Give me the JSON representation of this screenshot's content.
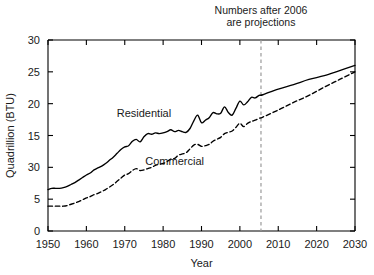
{
  "chart_data": {
    "type": "line",
    "title": "",
    "xlabel": "Year",
    "ylabel": "Quadrillion (BTU)",
    "xlim": [
      1950,
      2030
    ],
    "ylim": [
      0,
      30
    ],
    "grid": false,
    "legend": "inline-labels",
    "x_ticks": [
      "1950",
      "1960",
      "1970",
      "1980",
      "1990",
      "2000",
      "2010",
      "2020",
      "2030"
    ],
    "x_tick_values": [
      1950,
      1960,
      1970,
      1980,
      1990,
      2000,
      2010,
      2020,
      2030
    ],
    "y_ticks": [
      "30",
      "25",
      "20",
      "15",
      "30",
      "5",
      "0"
    ],
    "y_tick_values": [
      30,
      25,
      20,
      15,
      10,
      5,
      0
    ],
    "annotations": [
      {
        "name": "projection-note",
        "line1": "Numbers after 2006",
        "line2": "are projections",
        "rule_at_x": 2005.5
      }
    ],
    "series": [
      {
        "name": "Residential",
        "style": "solid",
        "label_x": 1975,
        "label_y": 17.9,
        "x": [
          1950,
          1951,
          1952,
          1953,
          1954,
          1955,
          1956,
          1957,
          1958,
          1959,
          1960,
          1961,
          1962,
          1963,
          1964,
          1965,
          1966,
          1967,
          1968,
          1969,
          1970,
          1971,
          1972,
          1973,
          1974,
          1975,
          1976,
          1977,
          1978,
          1979,
          1980,
          1981,
          1982,
          1983,
          1984,
          1985,
          1986,
          1987,
          1988,
          1989,
          1990,
          1991,
          1992,
          1993,
          1994,
          1995,
          1996,
          1997,
          1998,
          1999,
          2000,
          2001,
          2002,
          2003,
          2004,
          2005,
          2006,
          2010,
          2014,
          2018,
          2022,
          2026,
          2030
        ],
        "values": [
          6.5,
          6.7,
          6.7,
          6.7,
          6.8,
          7.0,
          7.3,
          7.6,
          8.0,
          8.4,
          8.8,
          9.1,
          9.6,
          9.9,
          10.2,
          10.6,
          11.1,
          11.6,
          12.2,
          12.8,
          13.2,
          13.4,
          14.1,
          14.4,
          14.0,
          14.8,
          15.3,
          15.2,
          15.4,
          15.3,
          15.4,
          15.6,
          15.9,
          15.6,
          15.8,
          15.6,
          15.5,
          16.1,
          17.3,
          18.2,
          17.0,
          17.4,
          17.8,
          18.6,
          18.4,
          18.5,
          19.5,
          18.6,
          18.2,
          19.3,
          20.4,
          19.8,
          20.3,
          21.0,
          20.9,
          21.3,
          21.4,
          22.3,
          23.0,
          23.8,
          24.4,
          25.2,
          26.0
        ]
      },
      {
        "name": "Commercial",
        "style": "dashed",
        "label_x": 1983,
        "label_y": 10.3,
        "x": [
          1950,
          1951,
          1952,
          1953,
          1954,
          1955,
          1956,
          1957,
          1958,
          1959,
          1960,
          1961,
          1962,
          1963,
          1964,
          1965,
          1966,
          1967,
          1968,
          1969,
          1970,
          1971,
          1972,
          1973,
          1974,
          1975,
          1976,
          1977,
          1978,
          1979,
          1980,
          1981,
          1982,
          1983,
          1984,
          1985,
          1986,
          1987,
          1988,
          1989,
          1990,
          1991,
          1992,
          1993,
          1994,
          1995,
          1996,
          1997,
          1998,
          1999,
          2000,
          2001,
          2002,
          2003,
          2004,
          2005,
          2006,
          2010,
          2014,
          2018,
          2022,
          2026,
          2030
        ],
        "values": [
          3.9,
          3.9,
          3.9,
          3.9,
          3.9,
          4.0,
          4.2,
          4.4,
          4.6,
          4.9,
          5.2,
          5.4,
          5.7,
          5.9,
          6.2,
          6.5,
          6.9,
          7.3,
          7.8,
          8.3,
          8.8,
          9.0,
          9.5,
          9.8,
          9.5,
          9.6,
          9.8,
          10.0,
          10.3,
          10.5,
          10.6,
          10.9,
          11.3,
          11.4,
          11.9,
          12.1,
          12.3,
          12.9,
          13.5,
          13.6,
          13.3,
          13.4,
          13.6,
          14.1,
          14.4,
          14.7,
          15.3,
          15.5,
          15.7,
          16.3,
          16.9,
          16.4,
          16.9,
          17.2,
          17.4,
          17.7,
          17.9,
          19.0,
          20.2,
          21.3,
          22.6,
          23.8,
          25.0
        ]
      }
    ]
  }
}
